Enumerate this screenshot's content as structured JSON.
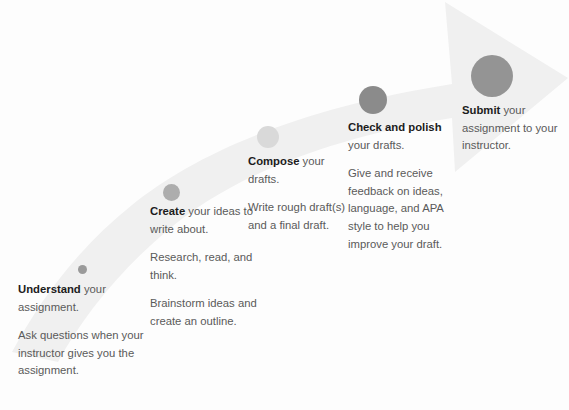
{
  "graphic": {
    "title": "The Writing Process",
    "background_color": "#fdfdfd",
    "arrow": {
      "name": "upward-curved-arrow",
      "fill_color": "#f0f0f0",
      "direction": "left-bottom to right-top"
    },
    "text_color": "#5a5a5a",
    "heading_color": "#1c1c1c"
  },
  "steps": [
    {
      "id": "understand",
      "dot_color": "#9a9a9a",
      "heading": "Understand",
      "heading_tail": " your assignment.",
      "body": "Ask questions when your instructor gives you the assignment."
    },
    {
      "id": "create",
      "dot_color": "#adadad",
      "heading": "Create",
      "heading_tail": " your ideas to write about.",
      "body": "Research, read, and think.",
      "body2": "Brainstorm ideas and create an outline."
    },
    {
      "id": "compose",
      "dot_color": "#d9d9d9",
      "heading": "Compose",
      "heading_tail": " your drafts.",
      "body": "Write rough draft(s) and a final draft."
    },
    {
      "id": "check",
      "dot_color": "#8b8b8b",
      "heading": "Check and polish",
      "heading_tail": " your drafts.",
      "body": "Give and receive feedback  on ideas, language, and APA style to help you improve your draft."
    },
    {
      "id": "submit",
      "dot_color": "#949494",
      "heading": "Submit",
      "heading_tail": " your assignment to your instructor."
    }
  ]
}
